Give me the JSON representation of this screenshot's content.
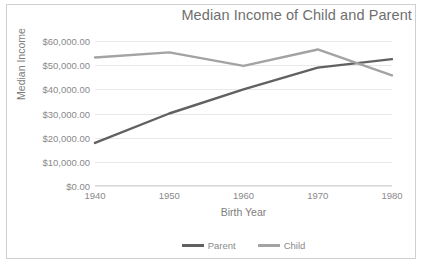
{
  "chart_data": {
    "type": "line",
    "title": "Median Income of Child and Parent",
    "xlabel": "Birth Year",
    "ylabel": "Median Income",
    "categories": [
      "1940",
      "1950",
      "1960",
      "1970",
      "1980"
    ],
    "x": [
      1940,
      1950,
      1960,
      1970,
      1980
    ],
    "xlim": [
      1940,
      1980
    ],
    "ylim": [
      0,
      60000
    ],
    "ytick_labels": [
      "$60,000.00",
      "$50,000.00",
      "$40,000.00",
      "$30,000.00",
      "$20,000.00",
      "$10,000.00",
      "$0.00"
    ],
    "ytick_values": [
      60000,
      50000,
      40000,
      30000,
      20000,
      10000,
      0
    ],
    "grid": "horizontal",
    "legend_position": "bottom-center",
    "series": [
      {
        "name": "Parent",
        "color": "#616161",
        "values": [
          17800,
          30000,
          40000,
          49000,
          52500
        ]
      },
      {
        "name": "Child",
        "color": "#a3a3a3",
        "values": [
          53200,
          55300,
          49700,
          56500,
          45800
        ]
      }
    ]
  },
  "legend": {
    "entries": [
      {
        "label": "Parent"
      },
      {
        "label": "Child"
      }
    ]
  }
}
